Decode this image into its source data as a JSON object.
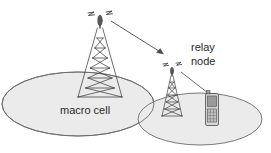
{
  "figure": {
    "background_color": "#ffffff"
  },
  "labels": {
    "macro_cell": "macro cell",
    "relay_line1": "relay",
    "relay_line2": "node"
  },
  "colors": {
    "cell_fill": "#ebebeb",
    "cell_stroke": "#6b6b6b",
    "line": "#4a4a4a",
    "text": "#2b2b2b",
    "tower_stroke": "#3d3d3d",
    "phone_body": "#d4d4d4",
    "phone_screen": "#9a9a9a",
    "phone_keypad": "#c2c2c2",
    "phone_stroke": "#4a4a4a"
  },
  "cells": [
    {
      "name": "macro-cell",
      "cx": 78,
      "cy": 104,
      "rx": 76,
      "ry": 32,
      "label": "macro cell"
    },
    {
      "name": "relay-cell",
      "cx": 200,
      "cy": 119,
      "rx": 62,
      "ry": 26,
      "label": ""
    }
  ],
  "towers": [
    {
      "name": "macro-base-station",
      "base_x": 100,
      "base_y": 97,
      "top_y": 19,
      "half_width_base": 22,
      "antenna": true,
      "rungs": 7
    },
    {
      "name": "relay-node-tower",
      "base_x": 172,
      "base_y": 116,
      "top_y": 71,
      "half_width_base": 11,
      "antenna": true,
      "rungs": 6
    }
  ],
  "links": [
    {
      "name": "backhaul-link-arrow",
      "from_x": 110,
      "from_y": 22,
      "to_x": 163,
      "to_y": 54,
      "arrowhead": true
    },
    {
      "name": "access-link-line",
      "from_x": 180,
      "from_y": 72,
      "to_x": 207,
      "to_y": 94,
      "arrowhead": false
    }
  ],
  "phone": {
    "name": "mobile-handset",
    "x": 205,
    "y": 93,
    "width": 14,
    "height": 33
  }
}
